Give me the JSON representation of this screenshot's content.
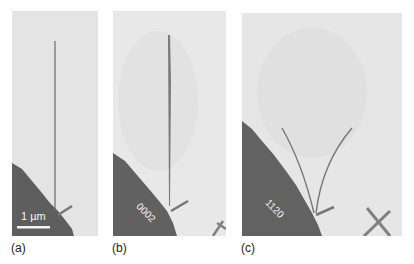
{
  "figure": {
    "panels": [
      {
        "id": "a",
        "caption": "(a)",
        "scale_bar_label": "1 µm"
      },
      {
        "id": "b",
        "caption": "(b)",
        "frame_number": "0002"
      },
      {
        "id": "c",
        "caption": "(c)",
        "frame_number": "1120"
      }
    ],
    "colors": {
      "background_film": "#e6e6e6",
      "substrate": "#5f5f5f",
      "nanowire": "#6d6d6d",
      "scale_bar": "#f4f4f4"
    }
  }
}
